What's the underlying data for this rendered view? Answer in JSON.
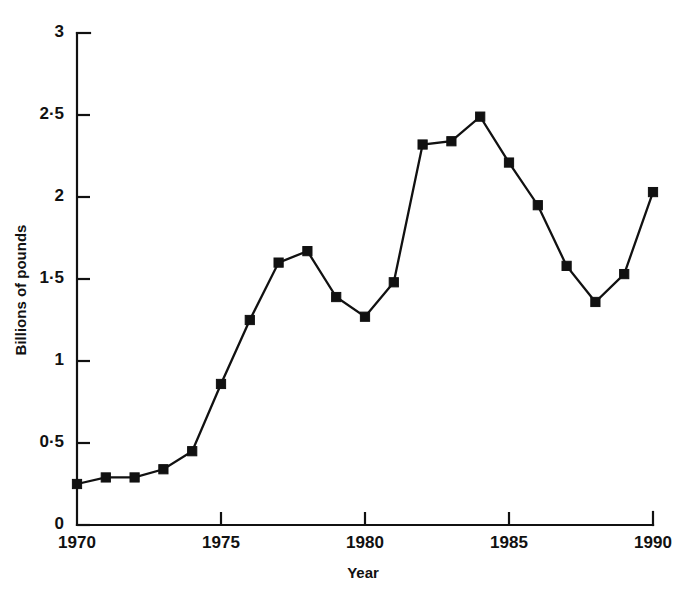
{
  "chart_data": {
    "type": "line",
    "title": "",
    "subtitle": "",
    "xlabel": "Year",
    "ylabel": "Billions of pounds",
    "xlim": [
      1970,
      1990
    ],
    "ylim": [
      0,
      3
    ],
    "grid": false,
    "legend": null,
    "marker": "filled-square",
    "line_color": "#111111",
    "marker_color": "#111111",
    "x_tick_labels": [
      "1970",
      "1975",
      "1980",
      "1985",
      "1990"
    ],
    "x_ticks": [
      1970,
      1975,
      1980,
      1985,
      1990
    ],
    "y_tick_labels": [
      "0",
      "0·5",
      "1",
      "1·5",
      "2",
      "2·5",
      "3"
    ],
    "y_ticks": [
      0,
      0.5,
      1,
      1.5,
      2,
      2.5,
      3
    ],
    "x": [
      1970,
      1971,
      1972,
      1973,
      1974,
      1975,
      1976,
      1977,
      1978,
      1979,
      1980,
      1981,
      1982,
      1983,
      1984,
      1985,
      1986,
      1987,
      1988,
      1989,
      1990
    ],
    "values": [
      0.25,
      0.29,
      0.29,
      0.34,
      0.45,
      0.86,
      1.25,
      1.6,
      1.67,
      1.39,
      1.27,
      1.48,
      2.32,
      2.34,
      2.49,
      2.21,
      1.95,
      1.58,
      1.36,
      1.53,
      2.03
    ],
    "series": [
      {
        "name": "Billions of pounds",
        "values": [
          0.25,
          0.29,
          0.29,
          0.34,
          0.45,
          0.86,
          1.25,
          1.6,
          1.67,
          1.39,
          1.27,
          1.48,
          2.32,
          2.34,
          2.49,
          2.21,
          1.95,
          1.58,
          1.36,
          1.53,
          2.03
        ]
      }
    ],
    "annotations": []
  },
  "axes": {
    "x_title": "Year",
    "y_title": "Billions of pounds"
  }
}
